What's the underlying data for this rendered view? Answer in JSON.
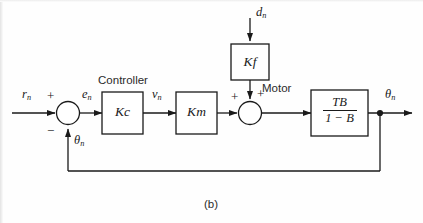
{
  "figure": {
    "caption": "(b)",
    "stroke_color": "#1a1a1a",
    "background": "#fefefe"
  },
  "signals": {
    "reference_input": "r",
    "reference_sub": "n",
    "error": "e",
    "error_sub": "n",
    "controller_output": "v",
    "controller_output_sub": "n",
    "disturbance": "d",
    "disturbance_sub": "n",
    "output": "θ",
    "output_sub": "n",
    "feedback": "θ",
    "feedback_sub": "n"
  },
  "summing_junction_1": {
    "name": "error-summing-junction",
    "sign_reference": "+",
    "sign_feedback": "−"
  },
  "summing_junction_2": {
    "name": "motor-summing-junction",
    "sign_forward": "+",
    "sign_disturbance": "+"
  },
  "blocks": {
    "controller": {
      "title": "Controller",
      "gain": "K",
      "gain_sub": "c"
    },
    "motor_gain": {
      "title": "Motor",
      "gain": "K",
      "gain_sub": "m"
    },
    "disturbance_gain": {
      "gain": "K",
      "gain_sub": "f"
    },
    "plant": {
      "numerator": "TB",
      "denominator": "1 − B"
    }
  }
}
